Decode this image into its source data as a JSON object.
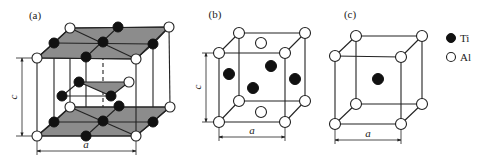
{
  "figure": {
    "panels": [
      {
        "id": "a",
        "label": "(a)",
        "label_pos": [
          35,
          18
        ],
        "dim_a": {
          "text": "a",
          "x1": 37,
          "x2": 136,
          "y": 151,
          "label_pos": [
            86,
            148
          ]
        },
        "dim_c": {
          "text": "c",
          "x": 22,
          "y1": 58,
          "y2": 136,
          "label_pos": [
            17,
            97
          ]
        },
        "box": {
          "front_top": [
            [
              37,
              58
            ],
            [
              136,
              59
            ]
          ],
          "back_top": [
            [
              70,
              28
            ],
            [
              169,
              27
            ]
          ],
          "front_bottom": [
            [
              37,
              136
            ],
            [
              136,
              136
            ]
          ],
          "back_bottom": [
            [
              70,
              107
            ],
            [
              170,
              107
            ]
          ]
        },
        "planes": [
          {
            "points": "54,43 70,28 118,27 169,27 153,44 136,59 86,57 37,58"
          },
          {
            "points": "79,82 129,82 111,96"
          },
          {
            "points": "54,122 70,107 119,106 170,107 153,122 136,136 86,136 37,136"
          }
        ],
        "ti_atoms": [
          [
            118,
            27
          ],
          [
            54,
            43
          ],
          [
            103,
            42
          ],
          [
            153,
            44
          ],
          [
            86,
            57
          ],
          [
            79,
            82
          ],
          [
            62,
            96
          ],
          [
            111,
            96
          ],
          [
            119,
            106
          ],
          [
            54,
            122
          ],
          [
            103,
            121
          ],
          [
            153,
            122
          ],
          [
            86,
            136
          ]
        ],
        "al_atoms": [
          [
            70,
            28
          ],
          [
            169,
            27
          ],
          [
            37,
            58
          ],
          [
            136,
            59
          ],
          [
            129,
            82
          ],
          [
            70,
            107
          ],
          [
            170,
            107
          ],
          [
            37,
            136
          ],
          [
            136,
            136
          ]
        ]
      },
      {
        "id": "b",
        "label": "(b)",
        "label_pos": [
          215,
          18
        ],
        "dim_a": {
          "text": "a",
          "x1": 219,
          "x2": 285,
          "y": 137,
          "label_pos": [
            252,
            134
          ]
        },
        "dim_c": {
          "text": "c",
          "x": 206,
          "y1": 53,
          "y2": 122,
          "label_pos": [
            201,
            87
          ]
        },
        "box": {
          "front_top": [
            [
              219,
              53
            ],
            [
              285,
              53
            ]
          ],
          "back_top": [
            [
              239,
              33
            ],
            [
              305,
              33
            ]
          ],
          "front_bottom": [
            [
              219,
              122
            ],
            [
              285,
              122
            ]
          ],
          "back_bottom": [
            [
              239,
              101
            ],
            [
              305,
              101
            ]
          ]
        },
        "ti_atoms": [
          [
            229,
            74
          ],
          [
            271,
            66
          ],
          [
            253,
            88
          ],
          [
            295,
            79
          ]
        ],
        "al_atoms": [
          [
            239,
            33
          ],
          [
            305,
            33
          ],
          [
            219,
            53
          ],
          [
            285,
            53
          ],
          [
            261,
            43
          ],
          [
            239,
            101
          ],
          [
            305,
            101
          ],
          [
            219,
            122
          ],
          [
            285,
            122
          ],
          [
            261,
            112
          ]
        ]
      },
      {
        "id": "c",
        "label": "(c)",
        "label_pos": [
          350,
          18
        ],
        "dim_a": {
          "text": "a",
          "x1": 335,
          "x2": 401,
          "y": 140,
          "label_pos": [
            368,
            137
          ]
        },
        "box": {
          "front_top": [
            [
              335,
              56
            ],
            [
              401,
              57
            ]
          ],
          "back_top": [
            [
              356,
              36
            ],
            [
              422,
              36
            ]
          ],
          "front_bottom": [
            [
              335,
              124
            ],
            [
              401,
              124
            ]
          ],
          "back_bottom": [
            [
              356,
              104
            ],
            [
              422,
              104
            ]
          ]
        },
        "ti_atoms": [
          [
            378,
            79
          ]
        ],
        "al_atoms": [
          [
            356,
            36
          ],
          [
            422,
            36
          ],
          [
            335,
            56
          ],
          [
            401,
            57
          ],
          [
            356,
            104
          ],
          [
            422,
            104
          ],
          [
            335,
            124
          ],
          [
            401,
            124
          ]
        ]
      }
    ],
    "legend": {
      "items": [
        {
          "symbol": "filled-circle",
          "label": "Ti",
          "pos": [
            451,
            38
          ]
        },
        {
          "symbol": "open-circle",
          "label": "Al",
          "pos": [
            451,
            57
          ]
        }
      ]
    }
  }
}
